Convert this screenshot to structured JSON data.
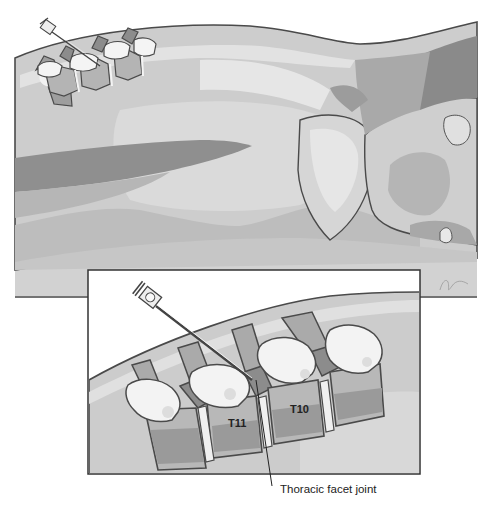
{
  "figure": {
    "main_view": {
      "subject": "patient-prone-torso",
      "instrument": "needle-icon"
    },
    "inset": {
      "vertebra_labels": [
        "T11",
        "T10"
      ],
      "callout_label": "Thoracic facet joint"
    },
    "colors": {
      "background": "#ffffff",
      "skin_light": "#d8d8d8",
      "skin_mid": "#c4c4c4",
      "skin_dark": "#9a9a9a",
      "bone_light": "#f2f2f2",
      "bone_mid": "#b8b8b8",
      "bone_dark": "#8a8a8a",
      "outline": "#4a4a4a",
      "table": "#c8c8c8"
    }
  }
}
